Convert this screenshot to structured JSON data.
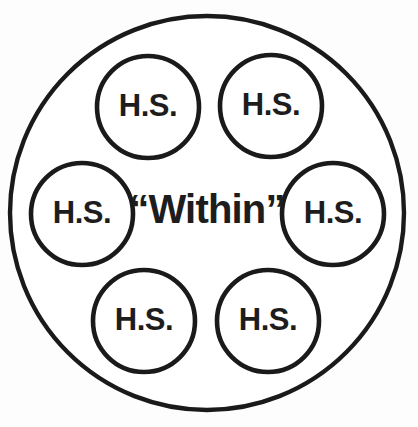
{
  "diagram": {
    "type": "venn-style-nested-circle-diagram",
    "background_color": "#fdfdfd",
    "stroke_color": "#1a1a1a",
    "text_color": "#1d1d1d",
    "outer_circle": {
      "label": "",
      "cx": 207,
      "cy": 213,
      "r": 197,
      "stroke_width": 4.4
    },
    "center_label": {
      "text": "“Within”",
      "x": 207,
      "y": 212,
      "font_size": 40
    },
    "nodes": [
      {
        "id": "hs-top-left",
        "label": "H.S.",
        "cx": 148,
        "cy": 107,
        "r": 51,
        "text_x": 148,
        "text_y": 108
      },
      {
        "id": "hs-top-right",
        "label": "H.S.",
        "cx": 271,
        "cy": 106,
        "r": 51,
        "text_x": 271,
        "text_y": 107
      },
      {
        "id": "hs-middle-left",
        "label": "H.S.",
        "cx": 82,
        "cy": 214,
        "r": 51,
        "text_x": 82,
        "text_y": 215
      },
      {
        "id": "hs-middle-right",
        "label": "H.S.",
        "cx": 333,
        "cy": 214,
        "r": 51,
        "text_x": 333,
        "text_y": 215
      },
      {
        "id": "hs-bottom-left",
        "label": "H.S.",
        "cx": 144,
        "cy": 321,
        "r": 51,
        "text_x": 144,
        "text_y": 322
      },
      {
        "id": "hs-bottom-right",
        "label": "H.S.",
        "cx": 268,
        "cy": 321,
        "r": 51,
        "text_x": 268,
        "text_y": 322
      }
    ]
  }
}
